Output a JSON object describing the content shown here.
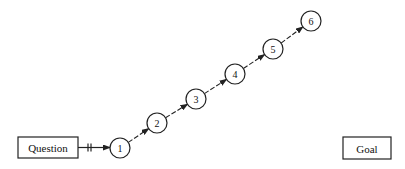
{
  "diagram": {
    "start_box": {
      "label": "Question",
      "x": 18,
      "y": 137,
      "w": 60,
      "h": 21
    },
    "end_box": {
      "label": "Goal",
      "x": 343,
      "y": 137,
      "w": 48,
      "h": 22
    },
    "nodes": [
      {
        "id": 1,
        "label": "1",
        "cx": 120,
        "cy": 148
      },
      {
        "id": 2,
        "label": "2",
        "cx": 157,
        "cy": 123
      },
      {
        "id": 3,
        "label": "3",
        "cx": 196,
        "cy": 99
      },
      {
        "id": 4,
        "label": "4",
        "cx": 235,
        "cy": 74
      },
      {
        "id": 5,
        "label": "5",
        "cx": 273,
        "cy": 49
      },
      {
        "id": 6,
        "label": "6",
        "cx": 311,
        "cy": 21
      }
    ],
    "node_radius": 10,
    "edges": [
      {
        "from": "start_box",
        "to": 1,
        "style": "double-tick"
      },
      {
        "from": 1,
        "to": 2,
        "style": "dashed-arrow"
      },
      {
        "from": 2,
        "to": 3,
        "style": "dashed-arrow"
      },
      {
        "from": 3,
        "to": 4,
        "style": "dashed-arrow"
      },
      {
        "from": 4,
        "to": 5,
        "style": "dashed-arrow"
      },
      {
        "from": 5,
        "to": 6,
        "style": "dashed-arrow"
      }
    ],
    "colors": {
      "stroke": "#222222",
      "background": "#ffffff"
    }
  }
}
